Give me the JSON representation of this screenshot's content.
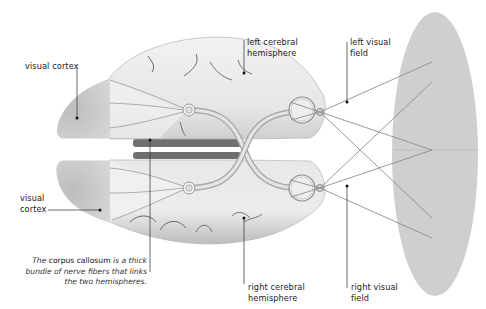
{
  "diagram": {
    "type": "anatomical-illustration",
    "labels": {
      "visual_cortex_top": "visual cortex",
      "visual_cortex_bottom_line1": "visual",
      "visual_cortex_bottom_line2": "cortex",
      "left_hemisphere_line1": "left cerebral",
      "left_hemisphere_line2": "hemisphere",
      "right_hemisphere_line1": "right cerebral",
      "right_hemisphere_line2": "hemisphere",
      "left_field_line1": "left visual",
      "left_field_line2": "field",
      "right_field_line1": "right visual",
      "right_field_line2": "field"
    },
    "caption": {
      "pre": "The",
      "term": "corpus callosum",
      "line1_rest": "is a thick",
      "line2": "bundle of nerve fibers that links",
      "line3": "the two hemispheres."
    },
    "colors": {
      "brain_fill": "#e9e9e9",
      "cortex_fill": "#c9c9c9",
      "visual_field_fill": "#cdcdcd",
      "ray_stroke": "#8f8f8f",
      "leader_stroke": "#444444",
      "callosum_dark": "#6f6f6f"
    }
  }
}
